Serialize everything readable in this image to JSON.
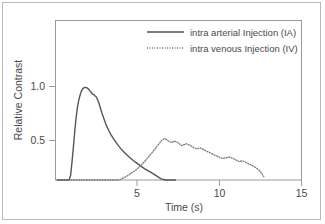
{
  "chart_data": {
    "type": "line",
    "title": "",
    "xlabel": "Time  (s)",
    "ylabel": "Relative Contrast",
    "xlim": [
      0,
      15
    ],
    "ylim": [
      0,
      1.15
    ],
    "xticks": [
      5,
      10,
      15
    ],
    "xtick_labels": [
      "5",
      "10",
      "15"
    ],
    "yticks": [
      0.5,
      1.0
    ],
    "ytick_labels": [
      "0.5",
      "1.0"
    ],
    "grid": false,
    "legend_position": "top-right-inside",
    "series": [
      {
        "name": "intra arterial Injection (IA)",
        "style": "solid",
        "color": "#555555",
        "x": [
          0.1,
          0.4,
          0.6,
          0.72,
          0.82,
          0.92,
          1.0,
          1.08,
          1.16,
          1.24,
          1.32,
          1.4,
          1.48,
          1.56,
          1.64,
          1.72,
          1.8,
          1.88,
          1.95,
          2.02,
          2.1,
          2.18,
          2.26,
          2.34,
          2.4,
          2.48,
          2.56,
          2.66,
          2.76,
          2.86,
          2.98,
          3.1,
          3.24,
          3.38,
          3.52,
          3.66,
          3.82,
          3.98,
          4.16,
          4.34,
          4.54,
          4.74,
          4.96,
          5.18,
          5.42,
          5.66,
          5.92,
          6.18,
          6.44,
          6.7,
          6.96,
          7.1,
          7.22,
          7.32
        ],
        "y": [
          0.01,
          0.015,
          0.025,
          0.045,
          0.09,
          0.175,
          0.29,
          0.42,
          0.56,
          0.69,
          0.79,
          0.86,
          0.91,
          0.95,
          0.975,
          0.988,
          0.992,
          0.99,
          0.985,
          0.975,
          0.96,
          0.945,
          0.93,
          0.925,
          0.915,
          0.905,
          0.88,
          0.84,
          0.79,
          0.74,
          0.69,
          0.64,
          0.595,
          0.555,
          0.52,
          0.49,
          0.455,
          0.425,
          0.395,
          0.368,
          0.34,
          0.315,
          0.29,
          0.265,
          0.24,
          0.218,
          0.195,
          0.17,
          0.145,
          0.118,
          0.085,
          0.06,
          0.035,
          0.012
        ]
      },
      {
        "name": "intra venous Injection (IV)",
        "style": "dotted",
        "color": "#777777",
        "x": [
          0.3,
          0.55,
          0.8,
          1.0,
          1.2,
          1.4,
          1.6,
          1.8,
          2.0,
          2.2,
          2.4,
          2.6,
          2.8,
          3.0,
          3.2,
          3.4,
          3.6,
          3.8,
          4.0,
          4.2,
          4.4,
          4.6,
          4.8,
          5.0,
          5.2,
          5.4,
          5.6,
          5.8,
          6.0,
          6.2,
          6.35,
          6.5,
          6.65,
          6.8,
          6.95,
          7.1,
          7.25,
          7.4,
          7.55,
          7.7,
          7.85,
          8.0,
          8.2,
          8.4,
          8.6,
          8.8,
          9.0,
          9.2,
          9.4,
          9.6,
          9.8,
          10.0,
          10.2,
          10.4,
          10.6,
          10.8,
          11.0,
          11.2,
          11.4,
          11.6,
          11.8,
          12.0,
          12.2,
          12.4,
          12.55,
          12.7
        ],
        "y": [
          0.01,
          0.022,
          0.032,
          0.04,
          0.05,
          0.046,
          0.055,
          0.062,
          0.058,
          0.068,
          0.078,
          0.072,
          0.085,
          0.095,
          0.105,
          0.098,
          0.112,
          0.125,
          0.142,
          0.158,
          0.175,
          0.195,
          0.215,
          0.24,
          0.268,
          0.3,
          0.335,
          0.372,
          0.408,
          0.448,
          0.478,
          0.505,
          0.518,
          0.505,
          0.488,
          0.482,
          0.495,
          0.485,
          0.47,
          0.452,
          0.462,
          0.47,
          0.455,
          0.438,
          0.422,
          0.432,
          0.42,
          0.402,
          0.388,
          0.372,
          0.358,
          0.345,
          0.332,
          0.34,
          0.348,
          0.335,
          0.32,
          0.305,
          0.312,
          0.298,
          0.282,
          0.268,
          0.25,
          0.228,
          0.2,
          0.165
        ]
      }
    ]
  },
  "legend": {
    "items": [
      {
        "label": "intra arterial Injection (IA)",
        "style": "solid"
      },
      {
        "label": "intra venous Injection (IV)",
        "style": "dotted"
      }
    ]
  },
  "axes": {
    "x_title": "Time  (s)",
    "y_title": "Relative Contrast",
    "x_tick_labels": [
      "5",
      "10",
      "15"
    ],
    "y_tick_labels": [
      "1.0",
      "0.5"
    ]
  },
  "colors": {
    "ia_line": "#555555",
    "iv_line": "#777777",
    "frame": "#9a9a9a",
    "outer_border": "#b9b9b9",
    "text": "#4a4a4a",
    "background": "#ffffff"
  }
}
